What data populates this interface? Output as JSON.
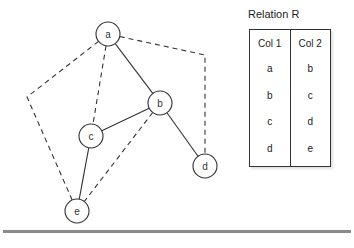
{
  "graph": {
    "nodes": [
      {
        "id": "a",
        "label": "a"
      },
      {
        "id": "b",
        "label": "b"
      },
      {
        "id": "c",
        "label": "c"
      },
      {
        "id": "d",
        "label": "d"
      },
      {
        "id": "e",
        "label": "e"
      }
    ],
    "solid_edges": [
      [
        "a",
        "b"
      ],
      [
        "b",
        "c"
      ],
      [
        "b",
        "d"
      ],
      [
        "c",
        "e"
      ]
    ],
    "dashed_edges": [
      [
        "a",
        "c"
      ],
      [
        "b",
        "e"
      ],
      [
        "a",
        "d"
      ],
      [
        "a",
        "e"
      ]
    ]
  },
  "relation": {
    "title": "Relation R",
    "columns": [
      "Col 1",
      "Col 2"
    ],
    "rows": [
      [
        "a",
        "b"
      ],
      [
        "b",
        "c"
      ],
      [
        "c",
        "d"
      ],
      [
        "d",
        "e"
      ]
    ]
  }
}
